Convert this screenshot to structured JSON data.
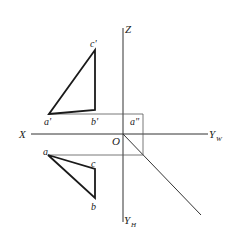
{
  "diagram": {
    "type": "orthographic-projection",
    "colors": {
      "line": "#333333",
      "thick": "#1a1a1a",
      "text": "#222222",
      "background": "#ffffff"
    },
    "axes": {
      "x_label": "X",
      "z_label": "Z",
      "yw_label": "Y",
      "yw_sub": "W",
      "yh_label": "Y",
      "yh_sub": "H",
      "origin_label": "O"
    },
    "front_view": {
      "a": "a'",
      "b": "b'",
      "c": "c'"
    },
    "top_view": {
      "a": "a",
      "b": "b",
      "c": "c"
    },
    "side_view": {
      "a": "a\""
    }
  }
}
